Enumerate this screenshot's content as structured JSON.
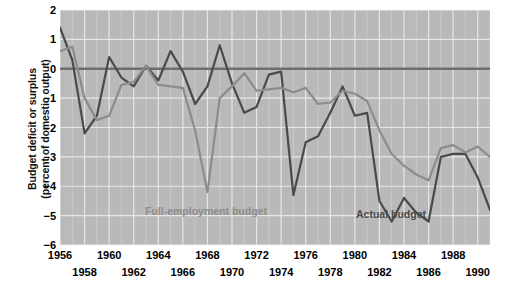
{
  "axis": {
    "ylabel_line1": "Budget deficit or surplus",
    "ylabel_line2": "(percent of domestic output)",
    "yticks": [
      "2",
      "1",
      "0",
      "-1",
      "-2",
      "-3",
      "-4",
      "-5",
      "-6"
    ],
    "xticks_top": [
      "1956",
      "1960",
      "1964",
      "1968",
      "1972",
      "1976",
      "1980",
      "1984",
      "1988"
    ],
    "xticks_bottom": [
      "1958",
      "1962",
      "1966",
      "1970",
      "1974",
      "1978",
      "1982",
      "1986",
      "1990"
    ]
  },
  "legend": {
    "full_employment": "Full-employment budget",
    "actual": "Actual budget"
  },
  "colors": {
    "plot_background": "#b9b9b9",
    "gridline": "#e8e8e8",
    "zero_line": "#6e6e6e",
    "actual_line": "#4a4a4a",
    "full_employment_line": "#8c8c8c",
    "text": "#000000"
  },
  "chart_data": {
    "type": "line",
    "title": "",
    "xlabel": "",
    "ylabel": "Budget deficit or surplus (percent of domestic output)",
    "xlim": [
      1956,
      1991
    ],
    "ylim": [
      -6,
      2
    ],
    "grid": true,
    "legend_position": "inline-annotation",
    "x": [
      1956,
      1957,
      1958,
      1959,
      1960,
      1961,
      1962,
      1963,
      1964,
      1965,
      1966,
      1967,
      1968,
      1969,
      1970,
      1971,
      1972,
      1973,
      1974,
      1975,
      1976,
      1977,
      1978,
      1979,
      1980,
      1981,
      1982,
      1983,
      1984,
      1985,
      1986,
      1987,
      1988,
      1989,
      1990,
      1991
    ],
    "series": [
      {
        "name": "Actual budget",
        "color": "#4a4a4a",
        "values": [
          1.4,
          0.3,
          -2.2,
          -1.6,
          0.4,
          -0.3,
          -0.6,
          0.1,
          -0.4,
          0.6,
          -0.1,
          -1.2,
          -0.6,
          0.8,
          -0.5,
          -1.5,
          -1.3,
          -0.2,
          -0.1,
          -4.3,
          -2.5,
          -2.3,
          -1.5,
          -0.6,
          -1.6,
          -1.5,
          -4.5,
          -5.2,
          -4.4,
          -4.9,
          -5.2,
          -3.0,
          -2.9,
          -2.9,
          -3.7,
          -4.8
        ]
      },
      {
        "name": "Full-employment budget",
        "color": "#8c8c8c",
        "values": [
          0.6,
          0.75,
          -1.0,
          -1.75,
          -1.6,
          -0.55,
          -0.45,
          0.1,
          -0.55,
          -0.6,
          -0.65,
          -2.1,
          -4.2,
          -1.0,
          -0.6,
          -0.15,
          -0.75,
          -0.7,
          -0.65,
          -0.8,
          -0.65,
          -1.2,
          -1.15,
          -0.75,
          -0.85,
          -1.1,
          -2.1,
          -2.9,
          -3.3,
          -3.6,
          -3.8,
          -2.7,
          -2.6,
          -2.85,
          -2.65,
          -3.0
        ]
      }
    ]
  }
}
